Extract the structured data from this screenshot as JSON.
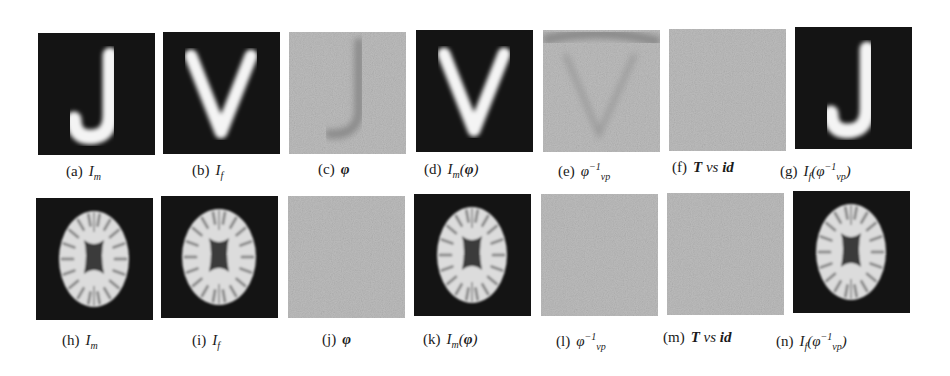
{
  "figure": {
    "rows": [
      {
        "name": "synthetic-letters",
        "panels": [
          {
            "id": "a",
            "label": "(a)",
            "math_html": "I<sub>m</sub>",
            "content": "letter-J",
            "background": "dark"
          },
          {
            "id": "b",
            "label": "(b)",
            "math_html": "I<sub>f</sub>",
            "content": "letter-V",
            "background": "dark"
          },
          {
            "id": "c",
            "label": "(c)",
            "math_html": "<b>φ</b>",
            "content": "deformation-J-shape",
            "background": "noise"
          },
          {
            "id": "d",
            "label": "(d)",
            "math_html": "I<sub>m</sub>(<b>φ</b>)",
            "content": "letter-V",
            "background": "dark"
          },
          {
            "id": "e",
            "label": "(e)",
            "math_html": "φ<sup>−1</sup><sub>vp</sub>",
            "content": "deformation-V-shape",
            "background": "noise"
          },
          {
            "id": "f",
            "label": "(f)",
            "math_html": "<b>T</b> vs <b>id</b>",
            "content": "uniform-noise",
            "background": "noise"
          },
          {
            "id": "g",
            "label": "(g)",
            "math_html": "I<sub>f</sub>(φ<sup>−1</sup><sub>vp</sub>)",
            "content": "letter-J",
            "background": "dark"
          }
        ]
      },
      {
        "name": "brain-mri",
        "panels": [
          {
            "id": "h",
            "label": "(h)",
            "math_html": "I<sub>m</sub>",
            "content": "brain-slice",
            "background": "dark"
          },
          {
            "id": "i",
            "label": "(i)",
            "math_html": "I<sub>f</sub>",
            "content": "brain-slice-wide",
            "background": "dark"
          },
          {
            "id": "j",
            "label": "(j)",
            "math_html": "<b>φ</b>",
            "content": "uniform-noise",
            "background": "noise"
          },
          {
            "id": "k",
            "label": "(k)",
            "math_html": "I<sub>m</sub>(<b>φ</b>)",
            "content": "brain-slice",
            "background": "dark"
          },
          {
            "id": "l",
            "label": "(l)",
            "math_html": "φ<sup>−1</sup><sub>vp</sub>",
            "content": "uniform-noise",
            "background": "noise"
          },
          {
            "id": "m",
            "label": "(m)",
            "math_html": "<b>T</b> vs <b>id</b>",
            "content": "uniform-noise",
            "background": "noise"
          },
          {
            "id": "n",
            "label": "(n)",
            "math_html": "I<sub>f</sub>(φ<sup>−1</sup><sub>vp</sub>)",
            "content": "brain-slice",
            "background": "dark"
          }
        ]
      }
    ],
    "colors": {
      "dark_bg": "#141414",
      "foreground": "#f4f4f4",
      "noise_bg": "#bcbcbc",
      "deform_shadow": "#8a8a8a",
      "brain_tissue": "#dcdcdc",
      "ventricle": "#3a3a3a"
    }
  }
}
